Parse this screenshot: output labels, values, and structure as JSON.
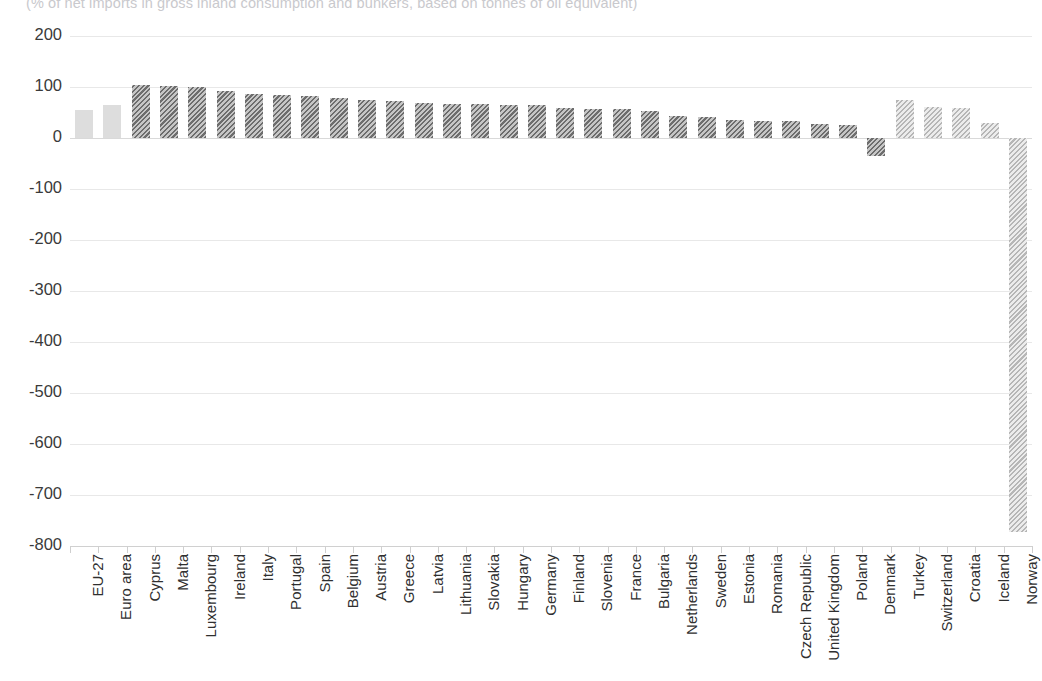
{
  "subtitle": "(% of net imports in gross inland consumption and bunkers, based on tonnes of oil equivalent)",
  "colors": {
    "aggregate_fill": "#dddddd",
    "eu_member_hatch": "#6d6d6d",
    "non_eu_hatch": "#b6b6b6",
    "gridline": "#e8e8e8",
    "axis_text": "#3a3a3a"
  },
  "chart_data": {
    "type": "bar",
    "title": "",
    "subtitle": "(% of net imports in gross inland consumption and bunkers, based on tonnes of oil equivalent)",
    "xlabel": "",
    "ylabel": "",
    "ylim": [
      -800,
      200
    ],
    "ytick_step": 100,
    "yticks": [
      200,
      100,
      0,
      -100,
      -200,
      -300,
      -400,
      -500,
      -600,
      -700,
      -800
    ],
    "ytick_labels": [
      "200",
      "100",
      "0",
      "-100",
      "-200",
      "-300",
      "-400",
      "-500",
      "-600",
      "-700",
      "-800"
    ],
    "grid": true,
    "legend": null,
    "categories": [
      "EU-27",
      "Euro area",
      "Cyprus",
      "Malta",
      "Luxembourg",
      "Ireland",
      "Italy",
      "Portugal",
      "Spain",
      "Belgium",
      "Austria",
      "Greece",
      "Latvia",
      "Lithuania",
      "Slovakia",
      "Hungary",
      "Germany",
      "Finland",
      "Slovenia",
      "France",
      "Bulgaria",
      "Netherlands",
      "Sweden",
      "Estonia",
      "Romania",
      "Czech Republic",
      "United Kingdom",
      "Poland",
      "Denmark",
      "Turkey",
      "Switzerland",
      "Croatia",
      "Iceland",
      "Norway"
    ],
    "values": [
      55,
      65,
      103,
      101,
      100,
      92,
      87,
      84,
      82,
      79,
      74,
      73,
      69,
      67,
      66,
      65,
      64,
      59,
      57,
      56,
      52,
      44,
      41,
      36,
      33,
      33,
      27,
      26,
      -35,
      75,
      60,
      59,
      29,
      -772
    ],
    "styles": [
      "solid-light",
      "solid-light",
      "hatch-dark",
      "hatch-dark",
      "hatch-dark",
      "hatch-dark",
      "hatch-dark",
      "hatch-dark",
      "hatch-dark",
      "hatch-dark",
      "hatch-dark",
      "hatch-dark",
      "hatch-dark",
      "hatch-dark",
      "hatch-dark",
      "hatch-dark",
      "hatch-dark",
      "hatch-dark",
      "hatch-dark",
      "hatch-dark",
      "hatch-dark",
      "hatch-dark",
      "hatch-dark",
      "hatch-dark",
      "hatch-dark",
      "hatch-dark",
      "hatch-dark",
      "hatch-dark",
      "hatch-dark",
      "hatch-light",
      "hatch-light",
      "hatch-light",
      "hatch-light",
      "hatch-light"
    ]
  }
}
